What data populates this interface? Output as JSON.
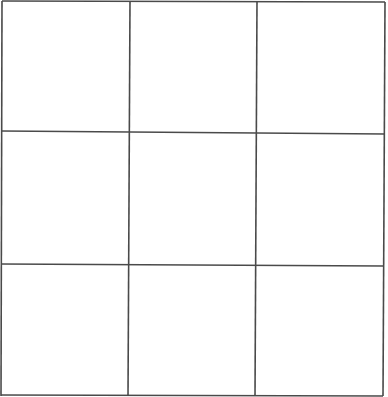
{
  "game": {
    "type": "tic-tac-toe",
    "rows": 3,
    "cols": 3,
    "line_color": "#4a4a4a",
    "background": "#ffffff",
    "cells": [
      "",
      "",
      "",
      "",
      "",
      "",
      "",
      "",
      ""
    ]
  }
}
